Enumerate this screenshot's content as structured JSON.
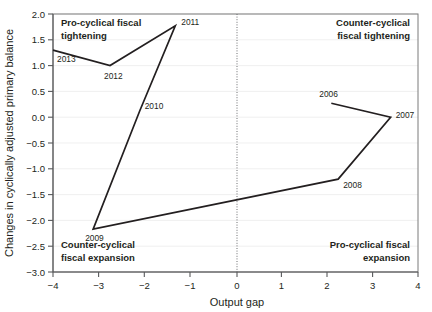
{
  "chart_data": {
    "type": "line",
    "title": "",
    "xlabel": "Output gap",
    "ylabel": "Changes in cyclically adjusted primary balance",
    "xlim": [
      -4,
      4
    ],
    "ylim": [
      -3.0,
      2.0
    ],
    "xticks": [
      -4,
      -3,
      -2,
      -1,
      0,
      1,
      2,
      3,
      4
    ],
    "xticklabels": [
      "−4",
      "−3",
      "−2",
      "−1",
      "0",
      "1",
      "2",
      "3",
      "4"
    ],
    "yticks": [
      -3.0,
      -2.5,
      -2.0,
      -1.5,
      -1.0,
      -0.5,
      0.0,
      0.5,
      1.0,
      1.5,
      2.0
    ],
    "yticklabels": [
      "−3.0",
      "−2.5",
      "−2.0",
      "−1.5",
      "−1.0",
      "−0.5",
      "0.0",
      "0.5",
      "1.0",
      "1.5",
      "2.0"
    ],
    "grid": true,
    "grid_axis": "y",
    "legend": "none",
    "line_color": "#231f20",
    "reference_lines": [
      {
        "name": "zero-output-gap",
        "axis": "x",
        "value": 0,
        "style": "dotted"
      }
    ],
    "series": [
      {
        "name": "fiscal-stance-path",
        "points": [
          {
            "label": "2006",
            "x": 2.1,
            "y": 0.27,
            "label_dx": -12,
            "label_dy": -6
          },
          {
            "label": "2007",
            "x": 3.4,
            "y": 0.0,
            "label_dx": 5,
            "label_dy": 1
          },
          {
            "label": "2008",
            "x": 2.25,
            "y": -1.2,
            "label_dx": 5,
            "label_dy": 9
          },
          {
            "label": "2009",
            "x": -3.12,
            "y": -2.17,
            "label_dx": -8,
            "label_dy": 12
          },
          {
            "label": "2010",
            "x": -2.1,
            "y": 0.12,
            "label_dx": 5,
            "label_dy": -2,
            "vertex": false
          },
          {
            "label": "2011",
            "x": -1.32,
            "y": 1.77,
            "label_dx": 6,
            "label_dy": -1
          },
          {
            "label": "2012",
            "x": -2.75,
            "y": 1.0,
            "label_dx": -6,
            "label_dy": 13
          },
          {
            "label": "2013",
            "x": -4.0,
            "y": 1.3,
            "label_dx": 4,
            "label_dy": 12
          }
        ]
      }
    ],
    "annotations": [
      {
        "name": "pro-cyclical-fiscal-tightening",
        "lines": [
          "Pro-cyclical fiscal",
          "tightening"
        ],
        "quadrant": "top-left"
      },
      {
        "name": "counter-cyclical-fiscal-tightening",
        "lines": [
          "Counter-cyclical",
          "fiscal tightening"
        ],
        "quadrant": "top-right"
      },
      {
        "name": "counter-cyclical-fiscal-expansion",
        "lines": [
          "Counter-cyclical",
          "fiscal expansion"
        ],
        "quadrant": "bottom-left"
      },
      {
        "name": "pro-cyclical-fiscal-expansion",
        "lines": [
          "Pro-cyclical fiscal",
          "expansion"
        ],
        "quadrant": "bottom-right"
      }
    ]
  }
}
